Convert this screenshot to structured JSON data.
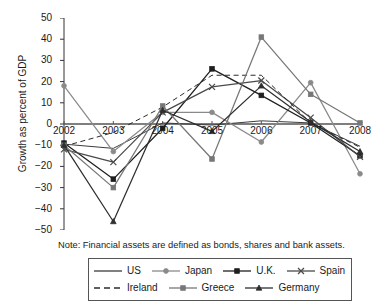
{
  "chart_data": {
    "type": "line",
    "title": "",
    "xlabel": "",
    "ylabel": "Growth as percent of GDP",
    "x": [
      2002,
      2003,
      2004,
      2005,
      2006,
      2007,
      2008
    ],
    "categories": [
      "2002",
      "2003",
      "2004",
      "2005",
      "2006",
      "2007",
      "2008"
    ],
    "ylim": [
      -50,
      50
    ],
    "yticks": [
      50,
      40,
      30,
      20,
      10,
      0,
      -10,
      -20,
      -30,
      -40,
      -50
    ],
    "ytick_labels": [
      "50",
      "40",
      "30",
      "20",
      "10",
      "0",
      "-10",
      "-20",
      "-30",
      "-40",
      "-50"
    ],
    "grid": false,
    "legend_position": "bottom",
    "series": [
      {
        "name": "US",
        "marker": "none",
        "dash": "solid",
        "color": "#3c3c3c",
        "values": [
          -9.5,
          -11.5,
          0.5,
          -0.5,
          1.5,
          0.5,
          -10.5
        ]
      },
      {
        "name": "Japan",
        "marker": "circle",
        "dash": "solid",
        "color": "#8a8a8a",
        "values": [
          18.0,
          -13.0,
          5.5,
          5.5,
          -8.5,
          19.5,
          -23.5
        ]
      },
      {
        "name": "U.K.",
        "marker": "square",
        "dash": "solid",
        "color": "#1f1f1f",
        "values": [
          -9.0,
          -26.0,
          -2.0,
          26.0,
          13.5,
          0.5,
          -15.0
        ]
      },
      {
        "name": "Spain",
        "marker": "x",
        "dash": "solid",
        "color": "#4a4a4a",
        "values": [
          -12.0,
          -18.0,
          5.5,
          17.5,
          20.5,
          3.0,
          -15.5
        ]
      },
      {
        "name": "Ireland",
        "marker": "none",
        "dash": "dashed",
        "color": "#2b2b2b",
        "values": [
          -10.5,
          -4.0,
          8.0,
          23.0,
          23.0,
          0.5,
          -11.0
        ]
      },
      {
        "name": "Greece",
        "marker": "square",
        "dash": "solid",
        "color": "#777777",
        "values": [
          -10.0,
          -30.0,
          8.5,
          -16.5,
          41.0,
          14.0,
          0.5
        ]
      },
      {
        "name": "Germany",
        "marker": "triangle",
        "dash": "solid",
        "color": "#2f2f2f",
        "values": [
          -10.0,
          -46.0,
          6.5,
          -3.5,
          18.0,
          1.0,
          -13.0
        ]
      }
    ],
    "note": "Note: Financial assets are defined as bonds, shares and bank assets."
  }
}
